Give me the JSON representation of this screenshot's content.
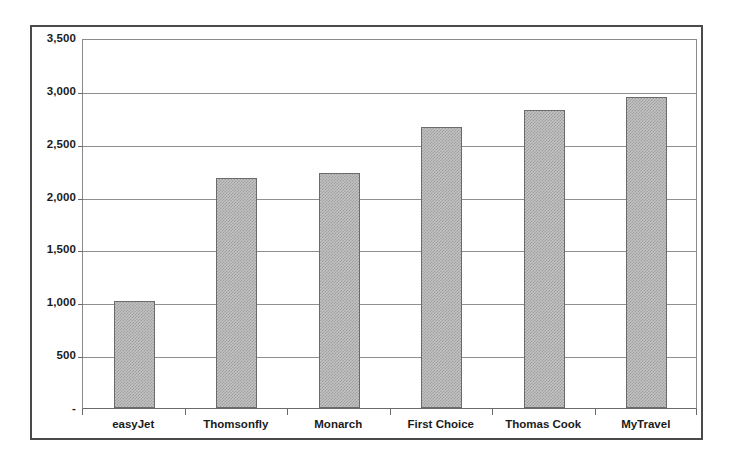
{
  "chart_data": {
    "type": "bar",
    "title": "",
    "subtitle": "",
    "xlabel": "",
    "ylabel": "",
    "categories": [
      "easyJet",
      "Thomsonfly",
      "Monarch",
      "First Choice",
      "Thomas Cook",
      "MyTravel"
    ],
    "values": [
      1010,
      2180,
      2220,
      2660,
      2815,
      2940
    ],
    "series": [
      {
        "name": "",
        "values": [
          1010,
          2180,
          2220,
          2660,
          2815,
          2940
        ]
      }
    ],
    "ylim": [
      0,
      3500
    ],
    "y_ticks": [
      0,
      500,
      1000,
      1500,
      2000,
      2500,
      3000,
      3500
    ],
    "y_tick_labels": [
      "-",
      "500",
      "1,000",
      "1,500",
      "2,000",
      "2,500",
      "3,000",
      "3,500"
    ],
    "grid": true,
    "grid_axis": "y",
    "legend": false,
    "legend_position": "none",
    "bar_fill_color": "#c3c3c3",
    "bar_pattern": "fine-checker-dither",
    "bar_border_color": "#6b6b6b",
    "gridline_color": "#8f8f8f",
    "frame_color": "#4a4a4a",
    "text_color": "#1b1b1b",
    "background_color": "#ffffff"
  }
}
